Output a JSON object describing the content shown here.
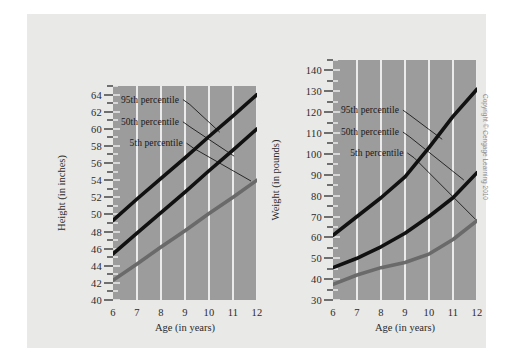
{
  "figure": {
    "copyright": "Copyright © Cengage Learning 2010",
    "background_color": "#e9e9e7",
    "plot_background_color": "#9c9c9c",
    "gridline_color": "#ebebeb"
  },
  "chart_data": [
    {
      "id": "height-chart",
      "type": "line",
      "title": "",
      "xlabel": "Age (in years)",
      "ylabel": "Height (in inches)",
      "x": [
        6,
        7,
        8,
        9,
        10,
        11,
        12
      ],
      "xticklabels": [
        "6",
        "7",
        "8",
        "9",
        "10",
        "11",
        "12"
      ],
      "xlim": [
        6,
        12
      ],
      "ylim": [
        40,
        65
      ],
      "yticks": [
        40,
        42,
        44,
        46,
        48,
        50,
        52,
        54,
        56,
        58,
        60,
        62,
        64
      ],
      "yticklabels": [
        "40",
        "42",
        "44",
        "46",
        "48",
        "50",
        "52",
        "54",
        "56",
        "58",
        "60",
        "62",
        "64"
      ],
      "y_minor_step": 1,
      "grid": "vertical",
      "legend": "annotated-labels",
      "series": [
        {
          "name": "95th percentile",
          "color": "#111111",
          "width": 3.6,
          "values": [
            49.3,
            51.8,
            54.2,
            56.6,
            59.1,
            61.5,
            64.0
          ]
        },
        {
          "name": "50th percentile",
          "color": "#111111",
          "width": 3.6,
          "values": [
            45.4,
            47.8,
            50.2,
            52.6,
            55.1,
            57.5,
            60.0
          ]
        },
        {
          "name": "5th percentile",
          "color": "#6a6a6a",
          "width": 3.6,
          "values": [
            42.3,
            44.2,
            46.2,
            48.1,
            50.1,
            52.0,
            54.0
          ]
        }
      ],
      "annotations": [
        {
          "text": "95th percentile",
          "x_frac": 0.055,
          "y_value": 63.3,
          "leader_to_x": 10.45,
          "leader_to_y_value": 59.6
        },
        {
          "text": "50th percentile",
          "x_frac": 0.055,
          "y_value": 60.7,
          "leader_to_x": 11.05,
          "leader_to_y_value": 56.8
        },
        {
          "text": "5th percentile",
          "x_frac": 0.115,
          "y_value": 58.2,
          "leader_to_x": 11.75,
          "leader_to_y_value": 53.9
        }
      ]
    },
    {
      "id": "weight-chart",
      "type": "line",
      "title": "",
      "xlabel": "Age (in years)",
      "ylabel": "Weight (in pounds)",
      "x": [
        6,
        7,
        8,
        9,
        10,
        11,
        12
      ],
      "xticklabels": [
        "6",
        "7",
        "8",
        "9",
        "10",
        "11",
        "12"
      ],
      "xlim": [
        6,
        12
      ],
      "ylim": [
        30,
        145
      ],
      "yticks": [
        30,
        40,
        50,
        60,
        70,
        80,
        90,
        100,
        110,
        120,
        130,
        140
      ],
      "yticklabels": [
        "30",
        "40",
        "50",
        "60",
        "70",
        "80",
        "90",
        "100",
        "110",
        "120",
        "130",
        "140"
      ],
      "y_minor_step": 5,
      "grid": "vertical",
      "legend": "annotated-labels",
      "series": [
        {
          "name": "95th percentile",
          "color": "#111111",
          "width": 3.6,
          "values": [
            61,
            70,
            79,
            89,
            103,
            118,
            131
          ]
        },
        {
          "name": "50th percentile",
          "color": "#111111",
          "width": 3.6,
          "values": [
            45.5,
            50,
            55.5,
            62,
            70,
            79,
            91
          ]
        },
        {
          "name": "5th percentile",
          "color": "#6a6a6a",
          "width": 3.6,
          "values": [
            37.5,
            42,
            45.5,
            48,
            52,
            59,
            68
          ]
        }
      ],
      "annotations": [
        {
          "text": "95th percentile",
          "x_frac": 0.055,
          "y_value": 120.5,
          "leader_to_x": 10.55,
          "leader_to_y_value": 107.0
        },
        {
          "text": "50th percentile",
          "x_frac": 0.055,
          "y_value": 110.0,
          "leader_to_x": 11.45,
          "leader_to_y_value": 87.5
        },
        {
          "text": "5th percentile",
          "x_frac": 0.12,
          "y_value": 100.0,
          "leader_to_x": 11.95,
          "leader_to_y_value": 68.5
        }
      ]
    }
  ]
}
